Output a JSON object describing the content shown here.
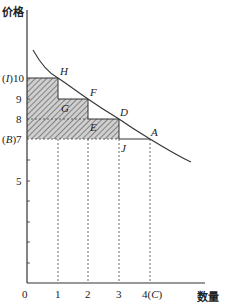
{
  "diagram": {
    "y_axis_label": "价格",
    "x_axis_label": "数量",
    "y_ticks": [
      {
        "value": 10,
        "label": "(I)10"
      },
      {
        "value": 9,
        "label": "9"
      },
      {
        "value": 8,
        "label": "8"
      },
      {
        "value": 7,
        "label": "(B)7"
      },
      {
        "value": 5,
        "label": "5"
      }
    ],
    "x_ticks": [
      {
        "value": 0,
        "label": "0"
      },
      {
        "value": 1,
        "label": "1"
      },
      {
        "value": 2,
        "label": "2"
      },
      {
        "value": 3,
        "label": "3"
      },
      {
        "value": 4,
        "label": "4(C)"
      }
    ],
    "points": [
      {
        "name": "H",
        "x": 1,
        "y": 10
      },
      {
        "name": "G",
        "x": 1,
        "y": 9
      },
      {
        "name": "F",
        "x": 2,
        "y": 9
      },
      {
        "name": "E",
        "x": 2,
        "y": 8
      },
      {
        "name": "D",
        "x": 3,
        "y": 8
      },
      {
        "name": "J",
        "x": 3,
        "y": 7
      },
      {
        "name": "A",
        "x": 4,
        "y": 7
      }
    ],
    "curve": "demand curve",
    "shaded_steps": [
      {
        "x_from": 0,
        "x_to": 1,
        "y_top": 10
      },
      {
        "x_from": 1,
        "x_to": 2,
        "y_top": 9
      },
      {
        "x_from": 2,
        "x_to": 3,
        "y_top": 8
      }
    ],
    "colors": {
      "line": "#333333",
      "hatch": "#7a7a7a",
      "fill": "#c8c8c8"
    }
  },
  "labels": {
    "y_axis": "价格",
    "x_axis": "数量",
    "y10_prefix": "(",
    "y10_letter": "I",
    "y10_suffix": ")10",
    "y9": "9",
    "y8": "8",
    "y7_prefix": "(",
    "y7_letter": "B",
    "y7_suffix": ")7",
    "y5": "5",
    "x0": "0",
    "x1": "1",
    "x2": "2",
    "x3": "3",
    "x4_num": "4(",
    "x4_letter": "C",
    "x4_close": ")",
    "H": "H",
    "G": "G",
    "F": "F",
    "E": "E",
    "D": "D",
    "J": "J",
    "A": "A"
  }
}
